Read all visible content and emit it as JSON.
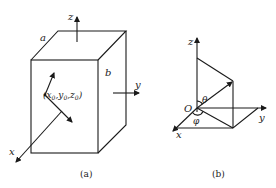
{
  "figure_a": {
    "caption": "(a)",
    "labels": {
      "edge_a": "a",
      "edge_b": "b",
      "axis_x": "x",
      "axis_y": "y",
      "axis_z": "z",
      "point": "(x0,y0,z0)",
      "point_parts": [
        "(x",
        "0",
        ",y",
        "0",
        ",z",
        "0",
        ")"
      ]
    }
  },
  "figure_b": {
    "caption": "(b)",
    "labels": {
      "axis_x": "x",
      "axis_y": "y",
      "axis_z": "z",
      "origin": "O",
      "polar_angle": "θ",
      "azimuth_angle": "φ"
    }
  }
}
